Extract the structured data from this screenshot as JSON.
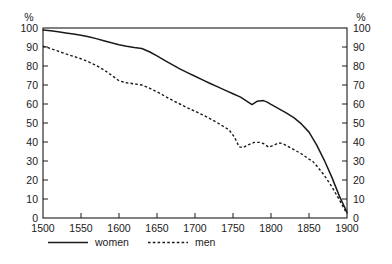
{
  "chart_data": {
    "type": "line",
    "title": "",
    "subtitle": "",
    "xlabel": "",
    "ylabel": "%",
    "ylabel_right": "%",
    "xlim": [
      1500,
      1900
    ],
    "ylim": [
      0,
      100
    ],
    "grid": false,
    "legend_position": "bottom",
    "x_ticks": [
      1500,
      1550,
      1600,
      1650,
      1700,
      1750,
      1800,
      1850,
      1900
    ],
    "y_ticks": [
      0,
      10,
      20,
      30,
      40,
      50,
      60,
      70,
      80,
      90,
      100
    ],
    "y_ticks_right": [
      0,
      10,
      20,
      30,
      40,
      50,
      60,
      70,
      80,
      90,
      100
    ],
    "series": [
      {
        "name": "women",
        "style": "solid",
        "color": "#1a1a1a",
        "x": [
          1500,
          1510,
          1520,
          1530,
          1540,
          1550,
          1560,
          1570,
          1580,
          1590,
          1600,
          1610,
          1620,
          1630,
          1640,
          1650,
          1660,
          1670,
          1680,
          1690,
          1700,
          1710,
          1720,
          1730,
          1740,
          1750,
          1760,
          1770,
          1775,
          1782,
          1790,
          1795,
          1800,
          1810,
          1820,
          1830,
          1840,
          1850,
          1860,
          1870,
          1880,
          1890,
          1900
        ],
        "values": [
          99,
          98.6,
          98,
          97.4,
          96.8,
          96.2,
          95.4,
          94.4,
          93.3,
          92.2,
          91.2,
          90.4,
          89.7,
          89.2,
          87.5,
          85.3,
          83,
          80.7,
          78.5,
          76.5,
          74.6,
          72.7,
          70.8,
          69,
          67.2,
          65.4,
          63.6,
          61,
          59.7,
          61.5,
          61.8,
          61,
          59.8,
          57.6,
          55.3,
          52.8,
          49.5,
          45.2,
          38.5,
          30.5,
          21.5,
          11.5,
          3
        ]
      },
      {
        "name": "men",
        "style": "dashed",
        "color": "#1a1a1a",
        "x": [
          1500,
          1510,
          1520,
          1530,
          1540,
          1550,
          1560,
          1570,
          1580,
          1590,
          1600,
          1610,
          1620,
          1630,
          1640,
          1650,
          1660,
          1670,
          1680,
          1690,
          1700,
          1710,
          1720,
          1730,
          1740,
          1745,
          1752,
          1758,
          1763,
          1770,
          1778,
          1785,
          1790,
          1797,
          1803,
          1810,
          1815,
          1820,
          1830,
          1840,
          1850,
          1855,
          1860,
          1870,
          1880,
          1890,
          1900
        ],
        "values": [
          90.5,
          89.2,
          87.8,
          86.4,
          85.1,
          83.8,
          82.2,
          80.3,
          78,
          75.2,
          72.2,
          71.2,
          70.6,
          70,
          68.4,
          66.4,
          64.2,
          62,
          60,
          58,
          56.2,
          54.3,
          52.2,
          50,
          47.6,
          46.3,
          42.5,
          37.5,
          37,
          38.5,
          39.8,
          39.8,
          39.2,
          37.3,
          38.2,
          39.5,
          39.2,
          38.2,
          36,
          33.8,
          31,
          29.8,
          27.5,
          22.5,
          16.5,
          9.5,
          2.2
        ]
      }
    ],
    "legend": [
      {
        "label": "women",
        "style": "solid"
      },
      {
        "label": "men",
        "style": "dashed"
      }
    ]
  }
}
